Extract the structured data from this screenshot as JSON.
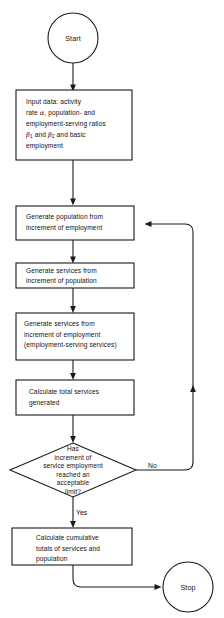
{
  "diagram": {
    "type": "flowchart",
    "nodes": [
      {
        "id": "start",
        "shape": "terminator",
        "label": "Start"
      },
      {
        "id": "input-data",
        "shape": "process",
        "lines": [
          "Input data: activity",
          "rate α, population- and",
          "employment-serving ratios",
          "β₁ and β₂ and basic",
          "employment"
        ]
      },
      {
        "id": "generate-population",
        "shape": "process",
        "lines": [
          "Generate population from",
          "increment of employment"
        ]
      },
      {
        "id": "generate-services-population",
        "shape": "process",
        "lines": [
          "Generate services from",
          "increment of population"
        ]
      },
      {
        "id": "generate-services-employment",
        "shape": "process",
        "lines": [
          "Generate services from",
          "increment of employment",
          "(employment-serving services)"
        ]
      },
      {
        "id": "calculate-total-services",
        "shape": "process",
        "lines": [
          "Calculate total services",
          "generated"
        ]
      },
      {
        "id": "limit-decision",
        "shape": "decision",
        "lines": [
          "Has",
          "increment of",
          "service employment",
          "reached an",
          "acceptable",
          "limit?"
        ]
      },
      {
        "id": "calculate-cumulative",
        "shape": "process",
        "lines": [
          "Calculate cumulative",
          "totals of services and",
          "population"
        ]
      },
      {
        "id": "stop",
        "shape": "terminator",
        "label": "Stop"
      }
    ],
    "edge_labels": {
      "decision_no": "No",
      "decision_yes": "Yes"
    },
    "colors": {
      "stroke": "#1a1a1a",
      "fill": "#ffffff",
      "text": "#111111"
    }
  }
}
